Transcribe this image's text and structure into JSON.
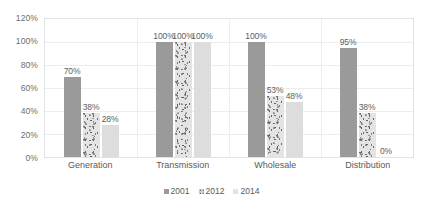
{
  "chart_data": {
    "type": "bar",
    "title": "",
    "xlabel": "",
    "ylabel": "",
    "ylim": [
      0,
      120
    ],
    "ytick_labels": [
      "0%",
      "20%",
      "40%",
      "60%",
      "80%",
      "100%",
      "120%"
    ],
    "ytick_values": [
      0,
      20,
      40,
      60,
      80,
      100,
      120
    ],
    "grid": true,
    "legend_position": "bottom-center",
    "value_suffix": "%",
    "categories": [
      "Generation",
      "Transmission",
      "Wholesale",
      "Distribution"
    ],
    "series": [
      {
        "name": "2001",
        "style": "solid-gray",
        "color": "#9a9a9a",
        "values": [
          70,
          100,
          100,
          95
        ],
        "labels": [
          "70%",
          "100%",
          "100%",
          "95%"
        ]
      },
      {
        "name": "2012",
        "style": "speckled",
        "color": "#d6d6d6",
        "values": [
          38,
          100,
          53,
          38
        ],
        "labels": [
          "38%",
          "100%",
          "53%",
          "38%"
        ]
      },
      {
        "name": "2014",
        "style": "light-gray",
        "color": "#dddddd",
        "values": [
          28,
          100,
          48,
          0
        ],
        "labels": [
          "28%",
          "100%",
          "48%",
          "0%"
        ]
      }
    ]
  },
  "legend": {
    "items": [
      {
        "label": "2001"
      },
      {
        "label": "2012"
      },
      {
        "label": "2014"
      }
    ]
  }
}
